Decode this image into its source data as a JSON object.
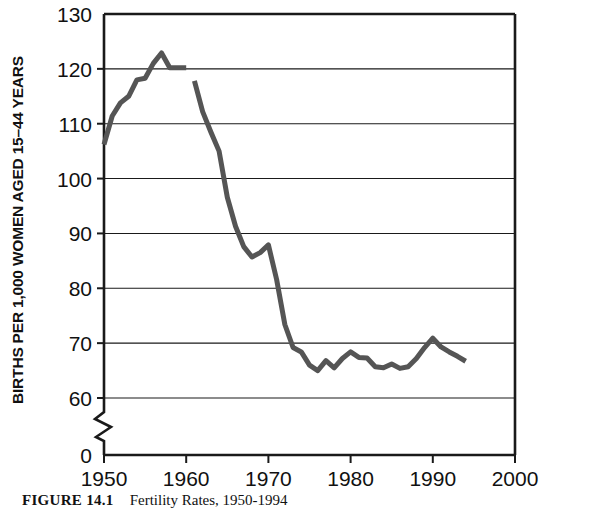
{
  "figure": {
    "caption_label": "FIGURE 14.1",
    "caption_text": "Fertility Rates, 1950-1994"
  },
  "chart_data": {
    "type": "line",
    "title": "",
    "subtitle": "",
    "xlabel": "",
    "ylabel": "BIRTHS PER 1,000 WOMEN AGED 15–44 YEARS",
    "xlim": [
      1950,
      2000
    ],
    "ylim": [
      60,
      130
    ],
    "y_axis_break": true,
    "y_break_from": 0,
    "y_break_to": 60,
    "grid": true,
    "grid_axis": "y",
    "legend": "none",
    "line_color": "#555555",
    "line_width_px": 5,
    "xticks": [
      1950,
      1960,
      1970,
      1980,
      1990,
      2000
    ],
    "xticklabels": [
      "1950",
      "1960",
      "1970",
      "1980",
      "1990",
      "2000"
    ],
    "yticks": [
      0,
      60,
      70,
      80,
      90,
      100,
      110,
      120,
      130
    ],
    "yticklabels": [
      "0",
      "60",
      "70",
      "80",
      "90",
      "100",
      "110",
      "120",
      "130"
    ],
    "series": [
      {
        "name": "Fertility rate (segment 1)",
        "x": [
          1950,
          1951,
          1952,
          1953,
          1954,
          1955,
          1956,
          1957,
          1958,
          1959,
          1960
        ],
        "values": [
          106.2,
          111.4,
          113.8,
          115.0,
          118.0,
          118.3,
          121.0,
          122.9,
          120.2,
          120.2,
          120.2
        ]
      },
      {
        "name": "Fertility rate (segment 2)",
        "x": [
          1961,
          1962,
          1963,
          1964,
          1965,
          1966,
          1967,
          1968,
          1969,
          1970,
          1971,
          1972,
          1973,
          1974,
          1975,
          1976,
          1977,
          1978,
          1979,
          1980,
          1981,
          1982,
          1983,
          1984,
          1985,
          1986,
          1987,
          1988,
          1989,
          1990,
          1991,
          1992,
          1993,
          1994
        ],
        "values": [
          117.8,
          112.2,
          108.5,
          105.0,
          96.6,
          91.3,
          87.6,
          85.7,
          86.5,
          87.9,
          81.6,
          73.4,
          69.2,
          68.4,
          66.0,
          65.0,
          66.8,
          65.5,
          67.2,
          68.4,
          67.4,
          67.3,
          65.7,
          65.5,
          66.2,
          65.4,
          65.7,
          67.2,
          69.2,
          70.9,
          69.3,
          68.4,
          67.6,
          66.7
        ]
      }
    ],
    "annotations": []
  }
}
